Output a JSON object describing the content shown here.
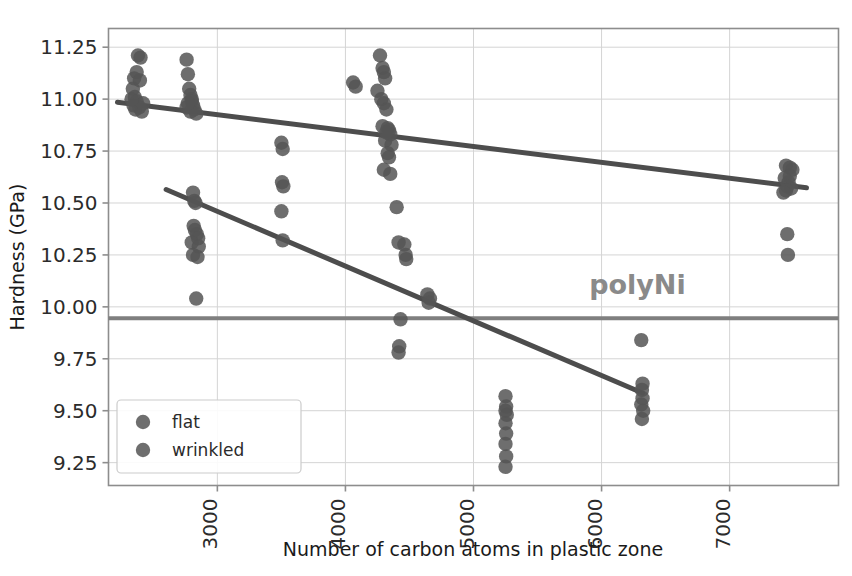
{
  "chart_data": {
    "type": "scatter",
    "title": "",
    "xlabel": "Number of carbon atoms in plastic zone",
    "ylabel": "Hardness (GPa)",
    "xlim": [
      2150,
      7850
    ],
    "ylim": [
      9.14,
      11.34
    ],
    "xticks": [
      3000,
      4000,
      5000,
      6000,
      7000
    ],
    "xtick_labels": [
      "3000",
      "4000",
      "5000",
      "6000",
      "7000"
    ],
    "yticks": [
      9.25,
      9.5,
      9.75,
      10.0,
      10.25,
      10.5,
      10.75,
      11.0,
      11.25
    ],
    "ytick_labels": [
      "9.25",
      "9.50",
      "9.75",
      "10.00",
      "10.25",
      "10.50",
      "10.75",
      "11.00",
      "11.25"
    ],
    "grid": true,
    "legend_position": "lower left",
    "marker_color": "#555555",
    "line_color": "#4d4d4d",
    "reference_line_color": "#7f7f7f",
    "series": [
      {
        "name": "flat",
        "marker_color": "#555555",
        "points": [
          [
            2380,
            11.21
          ],
          [
            2400,
            11.2
          ],
          [
            2370,
            11.13
          ],
          [
            2350,
            11.1
          ],
          [
            2395,
            11.09
          ],
          [
            2340,
            11.05
          ],
          [
            2355,
            11.01
          ],
          [
            2370,
            10.99
          ],
          [
            2345,
            10.97
          ],
          [
            2390,
            10.96
          ],
          [
            2360,
            10.95
          ],
          [
            2410,
            10.94
          ],
          [
            2420,
            10.98
          ],
          [
            2330,
            11.0
          ],
          [
            2760,
            11.19
          ],
          [
            2770,
            11.12
          ],
          [
            2780,
            11.05
          ],
          [
            2790,
            11.02
          ],
          [
            2800,
            10.99
          ],
          [
            2810,
            10.97
          ],
          [
            2760,
            10.96
          ],
          [
            2820,
            10.95
          ],
          [
            2835,
            10.93
          ],
          [
            2790,
            10.94
          ],
          [
            2800,
            11.0
          ],
          [
            2770,
            10.98
          ],
          [
            4060,
            11.08
          ],
          [
            4080,
            11.06
          ],
          [
            4270,
            11.21
          ],
          [
            4290,
            11.15
          ],
          [
            4300,
            11.13
          ],
          [
            4310,
            11.1
          ],
          [
            4250,
            11.04
          ],
          [
            4280,
            11.0
          ],
          [
            4300,
            10.98
          ],
          [
            4320,
            10.95
          ],
          [
            4330,
            10.86
          ],
          [
            4340,
            10.85
          ],
          [
            4350,
            10.83
          ],
          [
            4310,
            10.8
          ],
          [
            4360,
            10.78
          ],
          [
            4330,
            10.74
          ],
          [
            4340,
            10.72
          ],
          [
            4300,
            10.66
          ],
          [
            4350,
            10.64
          ],
          [
            4290,
            10.87
          ],
          [
            4320,
            10.84
          ],
          [
            7440,
            10.68
          ],
          [
            7470,
            10.67
          ],
          [
            7490,
            10.66
          ],
          [
            7430,
            10.62
          ],
          [
            7460,
            10.6
          ],
          [
            7450,
            10.58
          ],
          [
            7480,
            10.57
          ],
          [
            7440,
            10.56
          ],
          [
            7420,
            10.55
          ],
          [
            7470,
            10.63
          ]
        ]
      },
      {
        "name": "wrinkled",
        "marker_color": "#555555",
        "points": [
          [
            2810,
            10.55
          ],
          [
            2820,
            10.51
          ],
          [
            2830,
            10.5
          ],
          [
            2815,
            10.39
          ],
          [
            2825,
            10.37
          ],
          [
            2840,
            10.35
          ],
          [
            2850,
            10.33
          ],
          [
            2800,
            10.31
          ],
          [
            2855,
            10.29
          ],
          [
            2810,
            10.25
          ],
          [
            2845,
            10.24
          ],
          [
            2835,
            10.04
          ],
          [
            3500,
            10.79
          ],
          [
            3510,
            10.76
          ],
          [
            3505,
            10.6
          ],
          [
            3515,
            10.58
          ],
          [
            3500,
            10.46
          ],
          [
            3510,
            10.32
          ],
          [
            4400,
            10.48
          ],
          [
            4415,
            10.31
          ],
          [
            4460,
            10.3
          ],
          [
            4470,
            10.25
          ],
          [
            4475,
            10.23
          ],
          [
            4430,
            9.94
          ],
          [
            4420,
            9.81
          ],
          [
            4415,
            9.78
          ],
          [
            4640,
            10.06
          ],
          [
            4660,
            10.04
          ],
          [
            4650,
            10.02
          ],
          [
            5250,
            9.57
          ],
          [
            5255,
            9.52
          ],
          [
            5250,
            9.5
          ],
          [
            5260,
            9.48
          ],
          [
            5250,
            9.44
          ],
          [
            5255,
            9.39
          ],
          [
            5250,
            9.34
          ],
          [
            5255,
            9.28
          ],
          [
            5250,
            9.23
          ],
          [
            6310,
            9.84
          ],
          [
            6320,
            9.63
          ],
          [
            6315,
            9.6
          ],
          [
            6320,
            9.56
          ],
          [
            6310,
            9.53
          ],
          [
            6325,
            9.5
          ],
          [
            6315,
            9.46
          ],
          [
            7450,
            10.35
          ],
          [
            7455,
            10.25
          ]
        ]
      }
    ],
    "trend_lines": [
      {
        "name": "flat-trend",
        "x0": 2220,
        "y0": 10.985,
        "x1": 7600,
        "y1": 10.573,
        "color": "#4d4d4d"
      },
      {
        "name": "wrinkled-trend",
        "x0": 2600,
        "y0": 10.565,
        "x1": 6320,
        "y1": 9.585,
        "color": "#4d4d4d"
      }
    ],
    "reference_lines": [
      {
        "name": "polyNi-reference",
        "y": 9.945,
        "label": "polyNi",
        "color": "#7f7f7f",
        "label_x": 6280,
        "label_y": 10.06
      }
    ],
    "annotations": [
      {
        "text": "polyNi",
        "x": 6280,
        "y": 10.06
      }
    ]
  },
  "legend": {
    "entries": [
      {
        "label": "flat",
        "color": "#555555"
      },
      {
        "label": "wrinkled",
        "color": "#555555"
      }
    ]
  }
}
